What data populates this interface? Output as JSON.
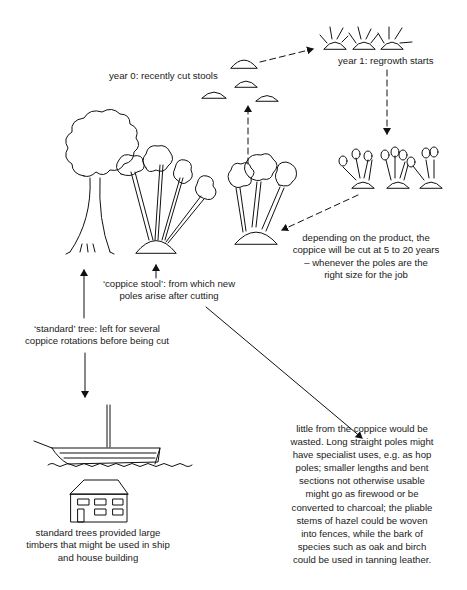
{
  "diagram": {
    "labels": {
      "year0": "year 0: recently cut stools",
      "year1": "year 1: regrowth starts",
      "cut_cycle": [
        "depending on the product, the",
        "coppice will be cut at 5 to 20 years",
        "– whenever the poles are the",
        "right size for the job"
      ],
      "coppice_stool": [
        "‘coppice stool’: from which new",
        "poles arise after cutting"
      ],
      "standard_tree": [
        "‘standard’ tree: left for several",
        "coppice rotations before being cut"
      ],
      "standard_uses": [
        "standard trees provided large",
        "timbers that might be used in ship",
        "and house building"
      ],
      "coppice_uses": [
        "little from the coppice would be",
        "wasted. Long straight poles might",
        "have specialist uses, e.g. as hop",
        "poles; smaller lengths and bent",
        "sections not otherwise usable",
        "might go as firewood or be",
        "converted to charcoal; the pliable",
        "stems of hazel could be woven",
        "into fences, while the bark of",
        "species such as oak and birch",
        "could be used in tanning leather."
      ]
    },
    "nodes": [
      {
        "id": "cut-stools",
        "icon": "cut-stools-icon"
      },
      {
        "id": "regrowth",
        "icon": "regrowth-stools-icon"
      },
      {
        "id": "young-poles",
        "icon": "young-coppice-icon"
      },
      {
        "id": "mature-coppice",
        "icon": "mature-coppice-icon"
      },
      {
        "id": "standard-tree",
        "icon": "standard-tree-icon"
      },
      {
        "id": "coppice-stool",
        "icon": "coppice-stool-icon"
      },
      {
        "id": "ship",
        "icon": "ship-icon"
      },
      {
        "id": "house",
        "icon": "house-icon"
      }
    ],
    "edges": [
      {
        "from": "cut-stools",
        "to": "regrowth",
        "style": "dashed"
      },
      {
        "from": "regrowth",
        "to": "young-poles",
        "style": "dashed"
      },
      {
        "from": "young-poles",
        "to": "mature-coppice",
        "style": "dashed"
      },
      {
        "from": "mature-coppice",
        "to": "cut-stools",
        "style": "dashed"
      },
      {
        "from": "standard-tree-label",
        "to": "standard-tree",
        "style": "solid"
      },
      {
        "from": "coppice-stool-label",
        "to": "coppice-stool",
        "style": "solid"
      },
      {
        "from": "standard-tree-label",
        "to": "ship",
        "style": "solid"
      },
      {
        "from": "coppice-stool-label",
        "to": "coppice-uses-label",
        "style": "solid"
      }
    ]
  }
}
